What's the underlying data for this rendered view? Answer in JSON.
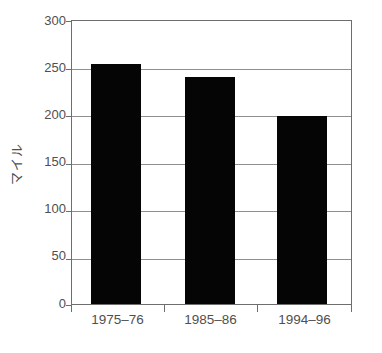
{
  "chart_data": {
    "type": "bar",
    "title": "",
    "subtitle": "",
    "xlabel": "",
    "ylabel": "マイル",
    "categories": [
      "1975–76",
      "1985–86",
      "1994–96"
    ],
    "values": [
      254,
      241,
      199
    ],
    "series": [
      {
        "name": "",
        "values": [
          254,
          241,
          199
        ]
      }
    ],
    "ylim": [
      0,
      300
    ],
    "yticks": [
      0,
      50,
      100,
      150,
      200,
      250,
      300
    ],
    "ytick_labels": [
      "0",
      "50",
      "100",
      "150",
      "200",
      "250",
      "300"
    ],
    "grid": true,
    "grid_axis": "y",
    "legend": false,
    "legend_position": "none",
    "bar_color": "#050505",
    "axis_color": "#6e6e6e",
    "grid_color": "#8f8f8f",
    "background_color": "#ffffff",
    "annotations": []
  },
  "axis": {
    "y_title": "マイル",
    "ticks": [
      {
        "label": "300",
        "value": 300
      },
      {
        "label": "250",
        "value": 250
      },
      {
        "label": "200",
        "value": 200
      },
      {
        "label": "150",
        "value": 150
      },
      {
        "label": "100",
        "value": 100
      },
      {
        "label": "50",
        "value": 50
      },
      {
        "label": "0",
        "value": 0
      }
    ]
  },
  "bars": [
    {
      "category": "1975–76",
      "value": 254
    },
    {
      "category": "1985–86",
      "value": 241
    },
    {
      "category": "1994–96",
      "value": 199
    }
  ]
}
